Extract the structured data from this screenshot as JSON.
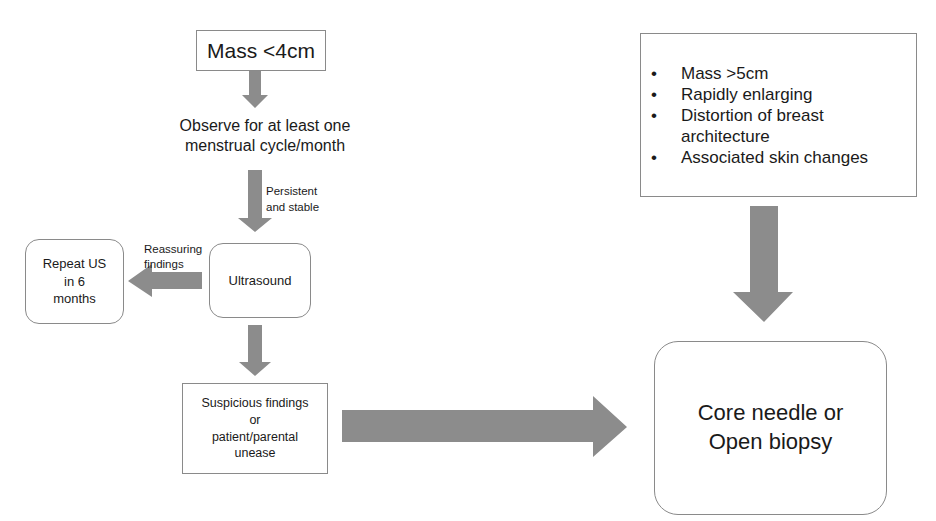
{
  "diagram": {
    "nodes": {
      "mass_small": {
        "label": "Mass <4cm"
      },
      "observe": {
        "lines": [
          "Observe for at least one",
          "menstrual cycle/month"
        ]
      },
      "ultrasound": {
        "label": "Ultrasound"
      },
      "repeat_us": {
        "lines": [
          "Repeat US",
          "in 6",
          "months"
        ]
      },
      "suspicious": {
        "lines": [
          "Suspicious findings",
          "or",
          "patient/parental",
          "unease"
        ]
      },
      "criteria": {
        "items": [
          "Mass >5cm",
          "Rapidly enlarging",
          "Distortion of breast architecture",
          "Associated skin changes"
        ]
      },
      "biopsy": {
        "lines": [
          "Core needle or",
          "Open biopsy"
        ]
      }
    },
    "edge_labels": {
      "persistent": [
        "Persistent",
        "and stable"
      ],
      "reassuring": [
        "Reassuring",
        "findings"
      ]
    },
    "colors": {
      "arrow": "#8c8c8c",
      "border": "#8a8a8a",
      "text": "#1a1a1a",
      "background": "#ffffff"
    }
  }
}
